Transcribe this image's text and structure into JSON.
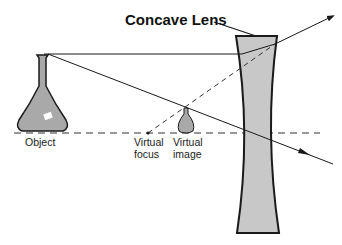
{
  "diagram": {
    "title": "Concave Lens",
    "labels": {
      "object": "Object",
      "virtual_focus_line1": "Virtual",
      "virtual_focus_line2": "focus",
      "virtual_image_line1": "Virtual",
      "virtual_image_line2": "image"
    },
    "colors": {
      "lens_fill": "#c8c8c8",
      "flask_fill": "#a9a9a9",
      "stroke": "#1a1a1a",
      "background": "#ffffff"
    },
    "elements": [
      "object-flask",
      "concave-lens",
      "principal-axis",
      "parallel-ray",
      "refracted-ray",
      "central-ray",
      "virtual-focus",
      "virtual-image"
    ]
  }
}
